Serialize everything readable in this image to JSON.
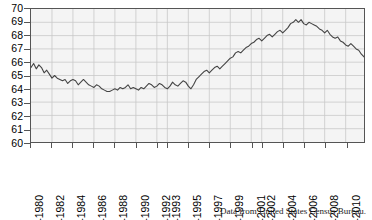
{
  "caption": "Data from United States Census Bureau.",
  "colors": {
    "line": "#444444",
    "plot_background": "#f4f4f4",
    "grid": "#c9c9c9",
    "frame": "#555555",
    "text": "#000000"
  },
  "chart_data": {
    "type": "line",
    "title": "",
    "xlabel": "",
    "ylabel": "",
    "ylim": [
      60,
      70
    ],
    "ytick_labels": [
      "60",
      "61",
      "62",
      "63",
      "64",
      "65",
      "66",
      "67",
      "68",
      "69",
      "70"
    ],
    "ytick_values": [
      60,
      61,
      62,
      63,
      64,
      65,
      66,
      67,
      68,
      69,
      70
    ],
    "grid": true,
    "legend": "none",
    "xtick_labels": [
      "Q1-1980",
      "Q1-1982",
      "Q1-1984",
      "Q1-1986",
      "Q1-1988",
      "Q1-1990",
      "Q1-1992",
      "Q1-1993",
      "Q1-1995",
      "Q1-1997",
      "Q1-1999",
      "Q1-2001",
      "Q1-2002",
      "Q1-2004",
      "Q1-2006",
      "Q1-2008",
      "Q1-2010"
    ],
    "xtick_index": [
      0,
      8,
      16,
      24,
      32,
      40,
      48,
      52,
      60,
      68,
      76,
      84,
      88,
      96,
      104,
      112,
      120
    ],
    "x_start_label": "Q1-1980",
    "x_end_label": "Q4-2011",
    "n_points": 128,
    "series": [
      {
        "name": "Homeownership rate (%)",
        "values": [
          65.6,
          65.9,
          65.5,
          65.8,
          65.6,
          65.2,
          65.4,
          65.1,
          64.8,
          65.0,
          64.8,
          64.7,
          64.6,
          64.7,
          64.4,
          64.6,
          64.7,
          64.6,
          64.3,
          64.5,
          64.7,
          64.5,
          64.3,
          64.2,
          64.1,
          64.3,
          64.2,
          64.0,
          63.9,
          63.8,
          63.8,
          63.9,
          64.0,
          63.9,
          64.1,
          64.0,
          64.1,
          64.3,
          64.0,
          64.1,
          64.0,
          63.9,
          64.1,
          64.0,
          64.2,
          64.4,
          64.3,
          64.1,
          64.2,
          64.4,
          64.3,
          64.1,
          64.0,
          64.2,
          64.5,
          64.3,
          64.2,
          64.4,
          64.6,
          64.5,
          64.2,
          64.0,
          64.3,
          64.7,
          64.9,
          65.1,
          65.3,
          65.4,
          65.2,
          65.4,
          65.6,
          65.7,
          65.5,
          65.7,
          65.9,
          66.1,
          66.3,
          66.4,
          66.7,
          66.8,
          66.7,
          66.9,
          67.1,
          67.2,
          67.4,
          67.5,
          67.7,
          67.8,
          67.6,
          67.8,
          68.0,
          68.1,
          67.9,
          68.1,
          68.3,
          68.4,
          68.2,
          68.4,
          68.6,
          68.9,
          69.0,
          69.2,
          69.0,
          69.2,
          68.9,
          68.8,
          69.0,
          68.9,
          68.8,
          68.7,
          68.5,
          68.4,
          68.2,
          68.4,
          68.1,
          67.9,
          67.8,
          67.9,
          67.6,
          67.5,
          67.3,
          67.2,
          67.4,
          67.2,
          67.0,
          66.9,
          66.6,
          66.4
        ]
      }
    ]
  }
}
